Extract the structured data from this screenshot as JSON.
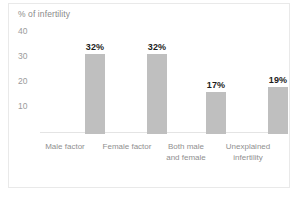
{
  "chart_data": {
    "type": "bar",
    "title": "",
    "subtitle": "",
    "xlabel": "",
    "ylabel": "% of infertility",
    "categories": [
      "Male factor",
      "Female factor",
      "Both male and female",
      "Unexplained infertility"
    ],
    "category_lines": [
      [
        "Male factor"
      ],
      [
        "Female factor"
      ],
      [
        "Both male",
        "and female"
      ],
      [
        "Unexplained",
        "infertility"
      ]
    ],
    "values": [
      32,
      32,
      17,
      19
    ],
    "data_labels": [
      "32%",
      "32%",
      "17%",
      "19%"
    ],
    "ylim": [
      0,
      44
    ],
    "yticks": [
      40,
      30,
      20,
      10
    ],
    "ytick_labels": [
      "40",
      "30",
      "20",
      "10"
    ],
    "grid": false,
    "legend": false,
    "legend_position": "none",
    "bar_color": "#bfbfbf",
    "value_label_color": "#1d1d1d",
    "axis_text_color": "#9b9b9b",
    "category_text_color": "#8f8f8f",
    "background_color": "#ffffff",
    "border_color": "#e9e9e9"
  }
}
